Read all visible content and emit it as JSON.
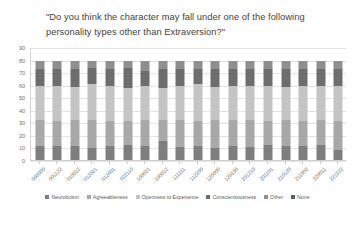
{
  "chart_data": {
    "type": "bar",
    "stacked": true,
    "title": "\"Do you think the character may fall under one of the following personality types other than Extraversion?\"",
    "xlabel": "",
    "ylabel": "",
    "ylim": [
      0,
      90
    ],
    "yticks": [
      0,
      10,
      20,
      30,
      40,
      50,
      60,
      70,
      80,
      90
    ],
    "grid": true,
    "legend_position": "bottom",
    "categories": [
      "000000",
      "001122",
      "010012",
      "012021",
      "012001",
      "022110",
      "100021",
      "100012",
      "111111",
      "112200",
      "120000",
      "120100",
      "201210",
      "201101",
      "210120",
      "211002",
      "220011",
      "221222"
    ],
    "series": [
      {
        "name": "Neuroticism",
        "color": "#7e7e7e",
        "values": [
          12,
          12,
          12,
          10,
          12,
          13,
          12,
          16,
          11,
          12,
          10,
          12,
          11,
          13,
          12,
          12,
          13,
          9
        ]
      },
      {
        "name": "Agreeableness",
        "color": "#a8a8a8",
        "values": [
          21,
          20,
          21,
          23,
          20,
          19,
          21,
          17,
          22,
          20,
          23,
          21,
          22,
          19,
          21,
          20,
          20,
          23
        ]
      },
      {
        "name": "Openness to Experience",
        "color": "#c4c4c4",
        "values": [
          27,
          28,
          26,
          28,
          28,
          26,
          27,
          25,
          27,
          29,
          26,
          27,
          27,
          28,
          26,
          28,
          27,
          28
        ]
      },
      {
        "name": "Conscientiousness",
        "color": "#6d6d6d",
        "values": [
          13,
          13,
          14,
          13,
          13,
          16,
          12,
          15,
          13,
          12,
          14,
          13,
          13,
          13,
          14,
          13,
          13,
          13
        ]
      },
      {
        "name": "Other",
        "color": "#8f8f8f",
        "values": [
          7,
          7,
          7,
          6,
          7,
          6,
          8,
          7,
          7,
          7,
          7,
          7,
          7,
          7,
          7,
          7,
          7,
          7
        ]
      },
      {
        "name": "None",
        "color": "#5f5f5f",
        "values": [
          0,
          0,
          0,
          0,
          0,
          0,
          0,
          0,
          0,
          0,
          0,
          0,
          0,
          0,
          0,
          0,
          0,
          0
        ]
      }
    ]
  }
}
